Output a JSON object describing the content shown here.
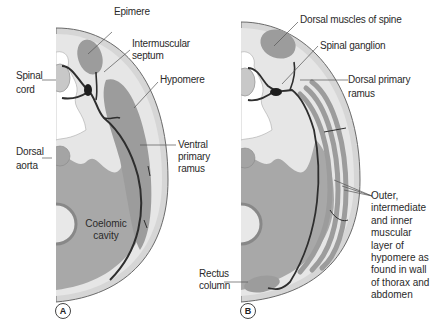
{
  "figure": {
    "panels": [
      {
        "id": "A",
        "badge": "A",
        "labels": {
          "epimere": "Epimere",
          "intermuscular_septum_1": "Intermuscular",
          "intermuscular_septum_2": "septum",
          "hypomere": "Hypomere",
          "spinal_cord_1": "Spinal",
          "spinal_cord_2": "cord",
          "dorsal_aorta_1": "Dorsal",
          "dorsal_aorta_2": "aorta",
          "ventral_primary_ramus_1": "Ventral",
          "ventral_primary_ramus_2": "primary",
          "ventral_primary_ramus_3": "ramus",
          "coelomic_cavity_1": "Coelomic",
          "coelomic_cavity_2": "cavity"
        }
      },
      {
        "id": "B",
        "badge": "B",
        "labels": {
          "dorsal_muscles": "Dorsal muscles of spine",
          "spinal_ganglion": "Spinal ganglion",
          "dorsal_primary_ramus_1": "Dorsal primary",
          "dorsal_primary_ramus_2": "ramus",
          "rectus_column_1": "Rectus",
          "rectus_column_2": "column",
          "muscle_layers": [
            "Outer,",
            "intermediate",
            "and inner",
            "muscular",
            "layer of",
            "hypomere as",
            "found in wall",
            "of thorax and",
            "abdomen"
          ]
        }
      }
    ],
    "colors": {
      "background": "#ffffff",
      "body_wall_light": "#e4e4e4",
      "outer_rim": "#d2d2d2",
      "muscle_dark": "#9a9a9a",
      "coelom": "#a6a6a6",
      "nerve": "#2e2e2e",
      "leader_line": "#555555"
    }
  }
}
